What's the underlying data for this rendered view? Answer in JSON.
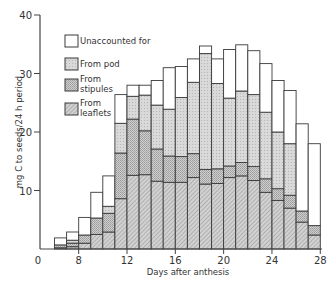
{
  "chart_data": {
    "type": "bar",
    "stacked": true,
    "title": "",
    "xlabel": "Days after anthesis",
    "ylabel": "mg C to seeds/24 h period",
    "ylim": [
      0,
      40
    ],
    "xlim": [
      0,
      28
    ],
    "x_ticks": [
      0,
      8,
      12,
      16,
      20,
      24,
      28
    ],
    "y_ticks": [
      10,
      20,
      30,
      40
    ],
    "grid": false,
    "legend_position": "upper-left inside",
    "categories": [
      6,
      7,
      8,
      9,
      10,
      11,
      12,
      13,
      14,
      15,
      16,
      17,
      18,
      19,
      20,
      21,
      22,
      23,
      24,
      25,
      26,
      27
    ],
    "series": [
      {
        "name": "From leaflets",
        "pattern": "dense-hatch",
        "values": [
          0.2,
          0.4,
          1.0,
          2.5,
          2.9,
          8.6,
          12.6,
          12.7,
          11.6,
          11.4,
          11.4,
          12.2,
          11.1,
          11.2,
          12.2,
          12.5,
          11.7,
          9.7,
          8.3,
          7.0,
          4.6,
          2.4
        ]
      },
      {
        "name": "From stipules",
        "pattern": "medium-stipple",
        "values": [
          0.5,
          0.6,
          1.4,
          2.8,
          3.2,
          7.8,
          9.6,
          7.5,
          5.5,
          4.5,
          4.4,
          4.1,
          2.5,
          2.5,
          2.0,
          2.3,
          2.4,
          2.3,
          2.0,
          2.2,
          1.9,
          1.6
        ]
      },
      {
        "name": "From pod",
        "pattern": "light-stipple",
        "values": [
          0.0,
          0.5,
          0.0,
          0.0,
          1.2,
          5.1,
          3.9,
          6.1,
          7.5,
          8.0,
          10.1,
          12.2,
          19.8,
          14.6,
          11.6,
          12.2,
          12.3,
          11.4,
          9.7,
          8.8,
          0.0,
          0.0
        ]
      },
      {
        "name": "Unaccounted for",
        "pattern": "white",
        "values": [
          1.2,
          1.4,
          3.0,
          4.4,
          5.2,
          4.9,
          1.9,
          1.7,
          4.2,
          7.1,
          5.3,
          4.0,
          1.3,
          4.2,
          8.3,
          7.9,
          7.5,
          8.3,
          8.8,
          9.1,
          14.9,
          14.0
        ]
      }
    ],
    "totals": [
      1.9,
      2.9,
      5.4,
      9.7,
      12.5,
      26.4,
      28.0,
      28.0,
      28.8,
      31.0,
      31.2,
      32.5,
      34.7,
      32.5,
      34.1,
      34.9,
      33.9,
      31.7,
      28.8,
      27.1,
      21.4,
      18.0
    ]
  },
  "axes": {
    "ylabel": "mg C to seeds/24 h period",
    "xlabel": "Days after anthesis",
    "x_tick_labels": [
      "0",
      "8",
      "12",
      "16",
      "20",
      "24",
      "28"
    ],
    "y_tick_labels": [
      "10",
      "20",
      "30",
      "40"
    ]
  },
  "legend": {
    "items": [
      {
        "label_lines": [
          "Unaccounted for"
        ],
        "pattern": "white"
      },
      {
        "label_lines": [
          "From pod"
        ],
        "pattern": "light-stipple"
      },
      {
        "label_lines": [
          "From",
          "stipules"
        ],
        "pattern": "medium-stipple"
      },
      {
        "label_lines": [
          "From",
          "leaflets"
        ],
        "pattern": "dense-hatch"
      }
    ]
  }
}
